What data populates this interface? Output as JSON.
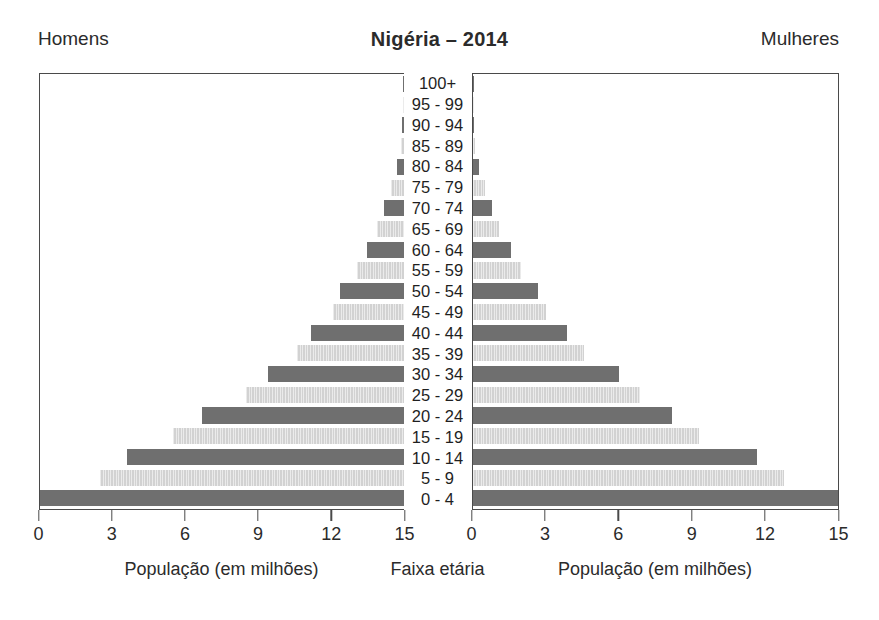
{
  "header": {
    "left_label": "Homens",
    "title": "Nigéria – 2014",
    "right_label": "Mulheres"
  },
  "footer": {
    "left_caption": "População (em milhões)",
    "center_caption": "Faixa etária",
    "right_caption": "População (em milhões)"
  },
  "axis": {
    "left_ticks": [
      "15",
      "12",
      "9",
      "6",
      "3",
      "0"
    ],
    "right_ticks": [
      "0",
      "3",
      "6",
      "9",
      "12",
      "15"
    ],
    "tick_values": [
      0,
      3,
      6,
      9,
      12,
      15
    ],
    "max": 15
  },
  "colors": {
    "bar_dark": "#6f6f6f",
    "bar_light": "#d2d2d2",
    "axis": "#4a4a4a",
    "text": "#2b2b2b",
    "background": "#ffffff"
  },
  "chart_data": {
    "type": "bar",
    "subtype": "population-pyramid",
    "title": "Nigéria – 2014",
    "xlabel": "População (em milhões)",
    "ylabel": "Faixa etária",
    "xlim": [
      0,
      15
    ],
    "grid": false,
    "legend_position": "top",
    "categories": [
      "100+",
      "95 - 99",
      "90 - 94",
      "85 - 89",
      "80 - 84",
      "75 - 79",
      "70 - 74",
      "65 - 69",
      "60 - 64",
      "55 - 59",
      "50 - 54",
      "45 - 49",
      "40 - 44",
      "35 - 39",
      "30 - 34",
      "25 - 29",
      "20 - 24",
      "15 - 19",
      "10 - 14",
      "5 - 9",
      "0 - 4"
    ],
    "series": [
      {
        "name": "Homens",
        "side": "left",
        "values": [
          0.01,
          0.02,
          0.05,
          0.12,
          0.25,
          0.5,
          0.8,
          1.1,
          1.5,
          1.9,
          2.6,
          2.9,
          3.8,
          4.4,
          5.6,
          6.5,
          8.3,
          9.5,
          11.4,
          12.5,
          15.0
        ]
      },
      {
        "name": "Mulheres",
        "side": "right",
        "values": [
          0.01,
          0.02,
          0.05,
          0.12,
          0.25,
          0.5,
          0.8,
          1.1,
          1.6,
          2.0,
          2.7,
          3.0,
          3.9,
          4.6,
          6.0,
          6.9,
          8.2,
          9.3,
          11.7,
          12.8,
          15.0
        ]
      }
    ],
    "bar_styles": [
      "dark",
      "light",
      "dark",
      "light",
      "dark",
      "light",
      "dark",
      "light",
      "dark",
      "light",
      "dark",
      "light",
      "dark",
      "light",
      "dark",
      "light",
      "dark",
      "light",
      "dark",
      "light",
      "dark"
    ]
  }
}
